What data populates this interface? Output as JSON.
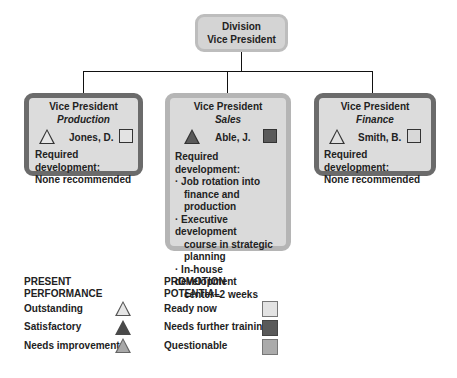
{
  "top": {
    "line1": "Division",
    "line2": "Vice President"
  },
  "vps": [
    {
      "title": "Vice President",
      "dept": "Production",
      "name": "Jones, D.",
      "performance": "outstanding",
      "potential": "ready-now",
      "dev_label": "Required development:",
      "dev": [
        "None recommended"
      ]
    },
    {
      "title": "Vice President",
      "dept": "Sales",
      "name": "Able, J.",
      "performance": "satisfactory",
      "potential": "needs-further-training",
      "dev_label": "Required development:",
      "dev": [
        "· Job rotation into",
        "finance and production",
        "· Executive development",
        "course in strategic",
        "planning",
        "· In-house development",
        "center–2 weeks"
      ]
    },
    {
      "title": "Vice President",
      "dept": "Finance",
      "name": "Smith, B.",
      "performance": "outstanding",
      "potential": "ready-now",
      "dev_label": "Required development:",
      "dev": [
        "None recommended"
      ]
    }
  ],
  "legend": {
    "performance": {
      "title1": "PRESENT",
      "title2": "PERFORMANCE",
      "items": [
        {
          "label": "Outstanding",
          "color": "#e6e6e6"
        },
        {
          "label": "Satisfactory",
          "color": "#5a5a5a"
        },
        {
          "label": "Needs improvement",
          "color": "#a8a8a8"
        }
      ]
    },
    "potential": {
      "title1": "PROMOTION",
      "title2": "POTENTIAL",
      "items": [
        {
          "label": "Ready now",
          "color": "#e3e3e3"
        },
        {
          "label": "Needs further training",
          "color": "#5a5a5a"
        },
        {
          "label": "Questionable",
          "color": "#ababab"
        }
      ]
    }
  }
}
